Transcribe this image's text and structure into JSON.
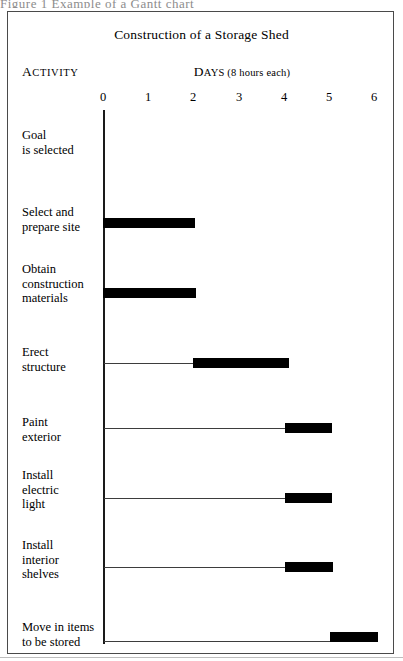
{
  "caption_strip": "Figure 1    Example of a Gantt chart",
  "chart_title": "Construction of a Storage Shed",
  "headers": {
    "activity_lead": "A",
    "activity_rest": "CTIVITY",
    "days_lead": "D",
    "days_rest": "AYS (8 hours each)"
  },
  "chart_data": {
    "type": "bar",
    "orientation": "horizontal",
    "subtype": "gantt",
    "title": "Construction of a Storage Shed",
    "xlabel": "DAYS (8 hours each)",
    "ylabel": "ACTIVITY",
    "xlim": [
      0,
      6.4
    ],
    "xticks": [
      0,
      1,
      2,
      3,
      4,
      5,
      6
    ],
    "xtick_labels": [
      "0",
      "1",
      "2",
      "3",
      "4",
      "5",
      "6"
    ],
    "grid": false,
    "legend": null,
    "bar_color": "#000000",
    "axis_color": "#1a1a1a",
    "categories": [
      "Goal\nis selected",
      "Select and\nprepare site",
      "Obtain\nconstruction\nmaterials",
      "Erect\nstructure",
      "Paint\nexterior",
      "Install\nelectric\nlight",
      "Install\ninterior\nshelves",
      "Move in items\nto be stored"
    ],
    "tasks": [
      {
        "name": "Goal is selected",
        "start": 0.0,
        "end": 0.0,
        "duration": 0.0
      },
      {
        "name": "Select and prepare site",
        "start": 0.0,
        "end": 2.03,
        "duration": 2.03
      },
      {
        "name": "Obtain construction materials",
        "start": 0.0,
        "end": 2.05,
        "duration": 2.05
      },
      {
        "name": "Erect structure",
        "start": 1.99,
        "end": 4.09,
        "duration": 2.1
      },
      {
        "name": "Paint exterior",
        "start": 4.02,
        "end": 5.07,
        "duration": 1.05
      },
      {
        "name": "Install electric light",
        "start": 4.02,
        "end": 5.07,
        "duration": 1.05
      },
      {
        "name": "Install interior shelves",
        "start": 4.02,
        "end": 5.09,
        "duration": 1.07
      },
      {
        "name": "Move in items to be stored",
        "start": 5.02,
        "end": 6.08,
        "duration": 1.06
      }
    ]
  },
  "rows": [
    {
      "label": "Goal\nis selected",
      "label_top": 128,
      "bar_y": null,
      "bar_x": null,
      "bar_w": null,
      "leader": null
    },
    {
      "label": "Select and\nprepare site",
      "label_top": 205,
      "bar_y": 218,
      "bar_x": 103,
      "bar_w": 92,
      "leader": null
    },
    {
      "label": "Obtain\nconstruction\nmaterials",
      "label_top": 262,
      "bar_y": 288,
      "bar_x": 103,
      "bar_w": 93,
      "leader": null
    },
    {
      "label": "Erect\nstructure",
      "label_top": 345,
      "bar_y": 358,
      "bar_x": 193,
      "bar_w": 96,
      "leader": {
        "x": 104,
        "w": 90,
        "y": 363
      }
    },
    {
      "label": "Paint\nexterior",
      "label_top": 415,
      "bar_y": 423,
      "bar_x": 285,
      "bar_w": 47,
      "leader": {
        "x": 104,
        "w": 182,
        "y": 428
      }
    },
    {
      "label": "Install\nelectric\nlight",
      "label_top": 468,
      "bar_y": 493,
      "bar_x": 285,
      "bar_w": 47,
      "leader": {
        "x": 104,
        "w": 182,
        "y": 498
      }
    },
    {
      "label": "Install\ninterior\nshelves",
      "label_top": 538,
      "bar_y": 562,
      "bar_x": 285,
      "bar_w": 48,
      "leader": {
        "x": 104,
        "w": 182,
        "y": 567
      }
    },
    {
      "label": "Move in items\nto be stored",
      "label_top": 620,
      "bar_y": 632,
      "bar_x": 330,
      "bar_w": 48,
      "leader": {
        "x": 104,
        "w": 227,
        "y": 641
      }
    }
  ],
  "ticks": [
    {
      "label": "0",
      "x": 103
    },
    {
      "label": "1",
      "x": 148
    },
    {
      "label": "2",
      "x": 193
    },
    {
      "label": "3",
      "x": 239
    },
    {
      "label": "4",
      "x": 284
    },
    {
      "label": "5",
      "x": 329
    },
    {
      "label": "6",
      "x": 374
    }
  ]
}
